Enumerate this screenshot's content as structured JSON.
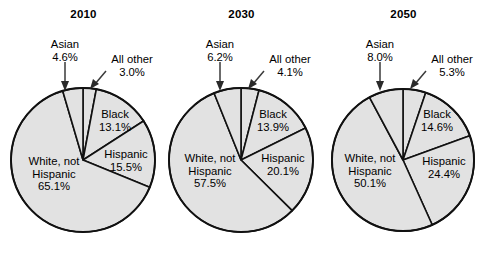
{
  "figure": {
    "type": "pie-chart-series",
    "background_color": "#ffffff",
    "slice_fill_color": "#e2e2e2",
    "slice_outline_color": "#111111",
    "text_color": "#000000"
  },
  "chart_data": {
    "type": "pie",
    "title": "",
    "subtitle": "",
    "xlabel": "",
    "ylabel": "",
    "legend_position": "none",
    "grid": false,
    "note": "Three pie charts of U.S. population share by race/ethnicity for 2010, 2030 and 2050. Slices are drawn clockwise starting at 12 o'clock in the order: All other, Black, Hispanic, White not Hispanic, Asian.",
    "categories": [
      "All other",
      "Black",
      "Hispanic",
      "White, not Hispanic",
      "Asian"
    ],
    "panels": [
      {
        "title": "2010",
        "values": [
          3.0,
          13.1,
          15.5,
          65.1,
          4.6
        ],
        "slices": [
          {
            "label": "All other",
            "value": 3.0,
            "value_text": "3.0%",
            "placement": "outside"
          },
          {
            "label": "Black",
            "value": 13.1,
            "value_text": "13.1%",
            "placement": "inside"
          },
          {
            "label": "Hispanic",
            "value": 15.5,
            "value_text": "15.5%",
            "placement": "inside"
          },
          {
            "label": "White, not Hispanic",
            "value": 65.1,
            "value_text": "65.1%",
            "placement": "inside"
          },
          {
            "label": "Asian",
            "value": 4.6,
            "value_text": "4.6%",
            "placement": "outside"
          }
        ]
      },
      {
        "title": "2030",
        "values": [
          4.1,
          13.9,
          20.1,
          57.5,
          6.2
        ],
        "slices": [
          {
            "label": "All other",
            "value": 4.1,
            "value_text": "4.1%",
            "placement": "outside"
          },
          {
            "label": "Black",
            "value": 13.9,
            "value_text": "13.9%",
            "placement": "inside"
          },
          {
            "label": "Hispanic",
            "value": 20.1,
            "value_text": "20.1%",
            "placement": "inside"
          },
          {
            "label": "White, not Hispanic",
            "value": 57.5,
            "value_text": "57.5%",
            "placement": "inside"
          },
          {
            "label": "Asian",
            "value": 6.2,
            "value_text": "6.2%",
            "placement": "outside"
          }
        ]
      },
      {
        "title": "2050",
        "values": [
          5.3,
          14.6,
          24.4,
          50.1,
          8.0
        ],
        "slices": [
          {
            "label": "All other",
            "value": 5.3,
            "value_text": "5.3%",
            "placement": "outside"
          },
          {
            "label": "Black",
            "value": 14.6,
            "value_text": "14.6%",
            "placement": "inside"
          },
          {
            "label": "Hispanic",
            "value": 24.4,
            "value_text": "24.4%",
            "placement": "inside"
          },
          {
            "label": "White, not Hispanic",
            "value": 50.1,
            "value_text": "50.1%",
            "placement": "inside"
          },
          {
            "label": "Asian",
            "value": 8.0,
            "value_text": "8.0%",
            "placement": "outside"
          }
        ]
      }
    ]
  },
  "labels": {
    "white_line1": "White, not",
    "white_line2": "Hispanic",
    "black": "Black",
    "hispanic": "Hispanic",
    "asian": "Asian",
    "all_other": "All other"
  }
}
